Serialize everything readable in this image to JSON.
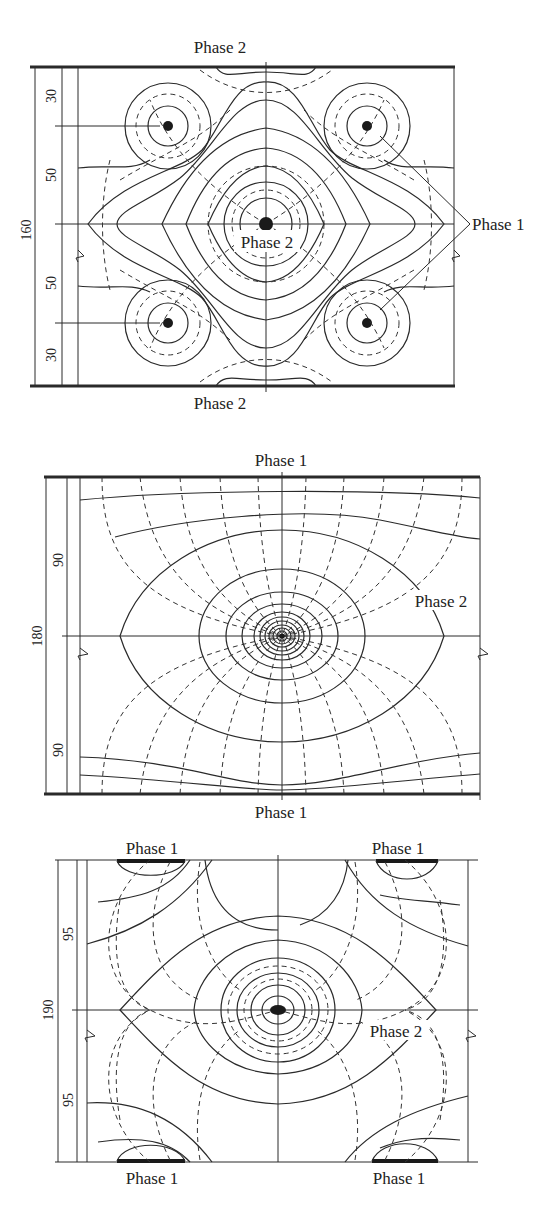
{
  "figure": {
    "colors": {
      "ink": "#2a2a2a",
      "background": "#ffffff"
    },
    "line_legend": {
      "solid": "equipotential lines",
      "dashed": "field lines"
    },
    "panels": [
      {
        "id": "panel-a",
        "top_label": "Phase 2",
        "bottom_label": "Phase 2",
        "center_label": "Phase 2",
        "side_label": "Phase 1",
        "total_dimension": "160",
        "dimensions": [
          "30",
          "50",
          "50",
          "30"
        ]
      },
      {
        "id": "panel-b",
        "top_label": "Phase 1",
        "bottom_label": "Phase 1",
        "center_label": "Phase 2",
        "total_dimension": "180",
        "dimensions": [
          "90",
          "90"
        ]
      },
      {
        "id": "panel-c",
        "top_left_label": "Phase 1",
        "top_right_label": "Phase 1",
        "bottom_left_label": "Phase 1",
        "bottom_right_label": "Phase 1",
        "center_label": "Phase 2",
        "total_dimension": "190",
        "dimensions": [
          "95",
          "95"
        ]
      }
    ]
  }
}
